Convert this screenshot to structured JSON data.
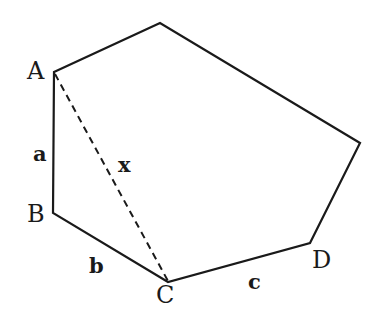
{
  "diagram": {
    "type": "polygon",
    "vertex_labels": {
      "A": "A",
      "B": "B",
      "C": "C",
      "D": "D"
    },
    "side_labels": {
      "a": "a",
      "b": "b",
      "c": "c",
      "x": "x"
    },
    "edges": [
      {
        "from": "A",
        "to": "B",
        "label": "a",
        "style": "solid"
      },
      {
        "from": "B",
        "to": "C",
        "label": "b",
        "style": "solid"
      },
      {
        "from": "C",
        "to": "D",
        "label": "c",
        "style": "solid"
      },
      {
        "from": "A",
        "to": "C",
        "label": "x",
        "style": "dashed"
      }
    ],
    "stroke_color": "#1a1a1a"
  }
}
